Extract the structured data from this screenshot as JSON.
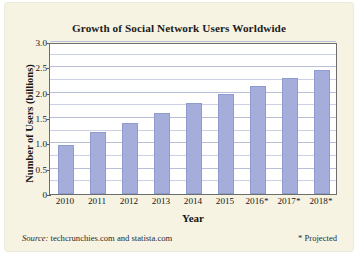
{
  "chart_data": {
    "type": "bar",
    "title": "Growth of Social Network Users Worldwide",
    "xlabel": "Year",
    "ylabel": "Number of Users (billions)",
    "categories": [
      "2010",
      "2011",
      "2012",
      "2013",
      "2014",
      "2015",
      "2016*",
      "2017*",
      "2018*"
    ],
    "values": [
      0.97,
      1.22,
      1.4,
      1.59,
      1.79,
      1.97,
      2.14,
      2.28,
      2.44
    ],
    "ylim": [
      0,
      3.0
    ],
    "y_ticks": [
      "0",
      "0.5",
      "1.0",
      "1.5",
      "2.0",
      "2.5",
      "3.0"
    ],
    "y_tick_values": [
      0,
      0.5,
      1.0,
      1.5,
      2.0,
      2.5,
      3.0
    ],
    "gridline_values": [
      0.25,
      0.5,
      0.75,
      1.0,
      1.25,
      1.5,
      1.75,
      2.0,
      2.25,
      2.5,
      2.75,
      3.0
    ],
    "grid": true,
    "legend": "none",
    "bar_color": "#a5aedb",
    "bar_border_color": "#8f9acd",
    "plot_background": "#ffffff",
    "page_background": "#f6f3e3"
  },
  "notes": {
    "source_label": "Source:",
    "source_text": "techcrunchies.com and statista.com",
    "projected": "* Projected"
  }
}
